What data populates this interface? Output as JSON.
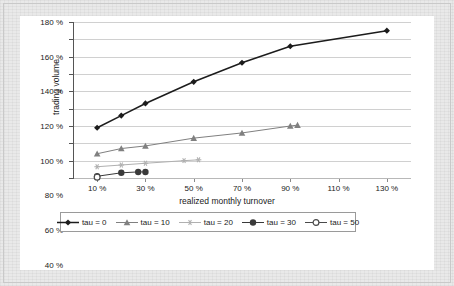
{
  "chart_data": {
    "type": "line",
    "title": "",
    "xlabel": "realized monthly turnover",
    "ylabel": "trading volume",
    "xlim": [
      0,
      140
    ],
    "ylim": [
      0,
      180
    ],
    "grid": true,
    "legend_position": "bottom",
    "x_tick_labels": [
      "10 %",
      "30 %",
      "50 %",
      "70 %",
      "90 %",
      "110 %",
      "130 %"
    ],
    "x_tick_values": [
      10,
      30,
      50,
      70,
      90,
      110,
      130
    ],
    "y_tick_labels": [
      "0 %",
      "20 %",
      "40 %",
      "60 %",
      "80 %",
      "100 %",
      "120 %",
      "140 %",
      "160 %",
      "180 %"
    ],
    "y_tick_values": [
      0,
      20,
      40,
      60,
      80,
      100,
      120,
      140,
      160,
      180
    ],
    "series": [
      {
        "name": "tau = 0",
        "marker": "diamond",
        "color": "#1c1c1c",
        "x": [
          10,
          20,
          30,
          50,
          70,
          90,
          130
        ],
        "y": [
          58,
          72,
          86,
          111,
          133,
          152,
          170
        ]
      },
      {
        "name": "tau = 10",
        "marker": "triangle",
        "color": "#808080",
        "x": [
          10,
          20,
          30,
          50,
          70,
          90,
          93
        ],
        "y": [
          28,
          34,
          37,
          46,
          52,
          60,
          61
        ]
      },
      {
        "name": "tau = 20",
        "marker": "asterisk",
        "color": "#b0b0b0",
        "x": [
          10,
          20,
          30,
          46,
          52
        ],
        "y": [
          13,
          15,
          17,
          20,
          21
        ]
      },
      {
        "name": "tau = 30",
        "marker": "circle-filled",
        "color": "#3a3a3a",
        "x": [
          10,
          20,
          27,
          30
        ],
        "y": [
          2,
          6,
          7,
          7
        ]
      },
      {
        "name": "tau = 50",
        "marker": "circle-open",
        "color": "#4a4a4a",
        "x": [
          10
        ],
        "y": [
          1
        ]
      }
    ]
  },
  "legend": {
    "items": [
      {
        "label": "tau = 0"
      },
      {
        "label": "tau = 10"
      },
      {
        "label": "tau = 20"
      },
      {
        "label": "tau = 30"
      },
      {
        "label": "tau = 50"
      }
    ]
  }
}
